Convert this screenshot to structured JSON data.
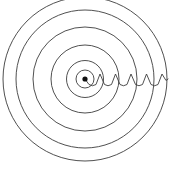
{
  "figure": {
    "title": "Concentric circular wavefronts radiating from a point source",
    "type": "diagram",
    "canvas": {
      "width": 171,
      "height": 173
    },
    "background_color": "#ffffff",
    "stroke_color": "#3c3c3c",
    "dot_color": "#111111",
    "stroke_width": 0.9
  },
  "source": {
    "label": "point-source",
    "cx": 85,
    "cy": 79,
    "r": 2.6,
    "color": "#111111"
  },
  "wavefronts": {
    "label": "concentric wavefront circles",
    "count": 6,
    "center": {
      "cx": 85,
      "cy": 79
    },
    "radii": [
      9,
      18.5,
      34,
      52,
      69,
      82
    ],
    "stroke": "#3c3c3c"
  },
  "ray": {
    "label": "wavy ray showing wavelength",
    "start_x": 85,
    "end_x": 168,
    "baseline_y": 79,
    "amplitude": 6.5,
    "cycles": 5,
    "path": "M 85 79 L 89 84.5 Q 92.5 87 96 84.5 L 100 74 L 104.5 84.5 Q 108 87 111.5 84.5 L 115.5 74 L 120 84.5 Q 123.5 87 127 84.5 L 131 74 L 135.5 84.5 Q 139 87 142.5 84.5 L 146.5 74 L 151 84.5 Q 154.5 87 158 84.5 L 162 74 L 166 80.5 L 168 79",
    "stroke": "#3c3c3c"
  },
  "annotations": []
}
